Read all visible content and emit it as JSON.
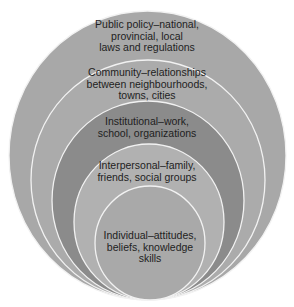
{
  "diagram": {
    "type": "nested-circles",
    "colors": {
      "background": "#ffffff",
      "outline": "#f2f2f2",
      "text": "#1e1e1e"
    },
    "levels": [
      {
        "id": "public-policy",
        "lines": [
          "Public policy–national,",
          "provincial, local",
          "laws and regulations"
        ],
        "fill": "#a8a8a8"
      },
      {
        "id": "community",
        "lines": [
          "Community–relationships",
          "between neighbourhoods,",
          "towns, cities"
        ],
        "fill": "#ababab"
      },
      {
        "id": "institutional",
        "lines": [
          "Institutional–work,",
          "school, organizations"
        ],
        "fill": "#8b8b8b"
      },
      {
        "id": "interpersonal",
        "lines": [
          "Interpersonal–family,",
          "friends, social groups"
        ],
        "fill": "#b1b1b1"
      },
      {
        "id": "individual",
        "lines": [
          "Individual–attitudes,",
          "beliefs, knowledge",
          "skills"
        ],
        "fill": "#a9a9a9"
      }
    ]
  }
}
